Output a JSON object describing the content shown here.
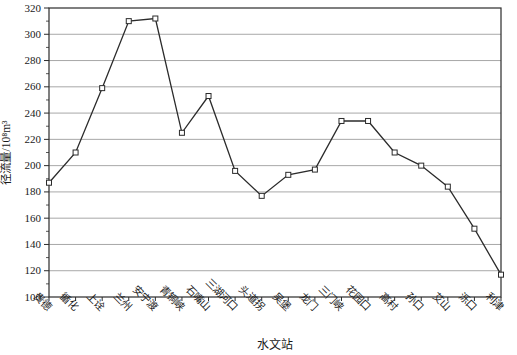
{
  "chart_data": {
    "type": "line",
    "title": "",
    "xlabel": "水文站",
    "ylabel": "径流量/10⁸m³",
    "categories": [
      "贵德",
      "循化",
      "上诠",
      "兰州",
      "安宁渡",
      "青铜峡",
      "石嘴山",
      "三湖河口",
      "头道拐",
      "吴堡",
      "龙门",
      "三门峡",
      "花园口",
      "高村",
      "孙口",
      "艾山",
      "泺口",
      "利津"
    ],
    "values": [
      187,
      210,
      259,
      310,
      312,
      225,
      253,
      196,
      177,
      193,
      197,
      234,
      234,
      210,
      200,
      184,
      152,
      117
    ],
    "ylim": [
      100,
      320
    ],
    "ytick_step": 20,
    "yminor_step": 10,
    "grid": true,
    "legend": "none",
    "marker": "open-square",
    "colors": {
      "line": "#2b2b2b",
      "axis": "#2b2b2b",
      "grid": "#9e9e9e",
      "marker_fill": "#ffffff",
      "text": "#1a1a1a",
      "background": "#ffffff"
    }
  }
}
